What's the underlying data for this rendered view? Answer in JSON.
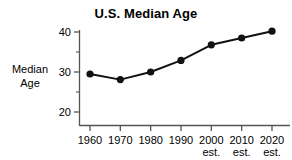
{
  "chart_data": {
    "type": "line",
    "title": "U.S. Median Age",
    "xlabel": "",
    "ylabel": "Median Age",
    "ylabel_lines": [
      "Median",
      "Age"
    ],
    "categories": [
      "1960",
      "1970",
      "1980",
      "1990",
      "2000",
      "2010",
      "2020"
    ],
    "category_sublabels": [
      "",
      "",
      "",
      "",
      "est.",
      "est.",
      "est."
    ],
    "values": [
      29.5,
      28.1,
      30.0,
      32.9,
      36.8,
      38.5,
      40.2
    ],
    "series": [
      {
        "name": "Median Age",
        "values": [
          29.5,
          28.1,
          30.0,
          32.9,
          36.8,
          38.5,
          40.2
        ]
      }
    ],
    "ylim": [
      16,
      41
    ],
    "yticks": [
      20,
      30,
      40
    ],
    "ytick_labels": [
      "20",
      "30",
      "40"
    ],
    "yminor_ticks": [
      25,
      35
    ],
    "grid": false,
    "legend": false,
    "legend_position": "none",
    "marker": "filled-circle",
    "line_color": "#111111",
    "marker_color": "#111111",
    "axis_color": "#555555",
    "background": "#ffffff"
  },
  "axes": {
    "y_axis_name": "median-age-axis",
    "x_axis_name": "year-axis"
  }
}
